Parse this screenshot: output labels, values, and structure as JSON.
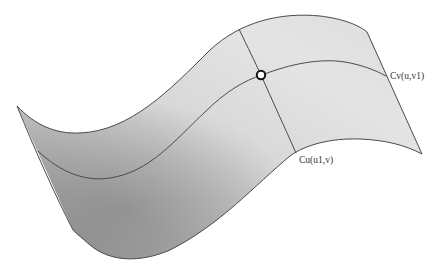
{
  "diagram": {
    "type": "parametric-surface",
    "colors": {
      "surface_dark": "#9e9e9e",
      "surface_mid": "#c4c4c4",
      "surface_light": "#e2e2e2",
      "edge": "#444444",
      "curve": "#4a4a4a",
      "point_fill": "#ffffff",
      "point_stroke": "#111111"
    },
    "labels": {
      "cv_curve": "Cv(u,v1)",
      "cu_curve": "Cu(u1,v)"
    },
    "intersection_point": {
      "x": 261,
      "y": 75
    }
  }
}
